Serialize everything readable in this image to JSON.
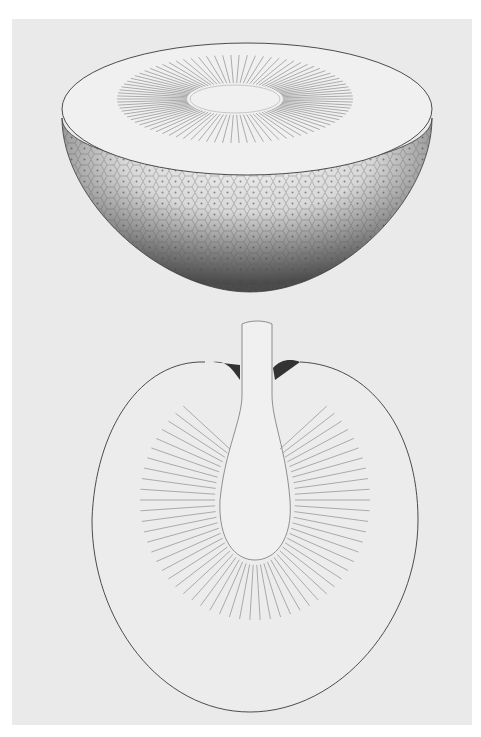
{
  "image": {
    "subject": "Botanical illustration of breadfruit cross-sections",
    "figures": [
      {
        "name": "halved-fruit-top",
        "description": "Hemispherical half of fruit showing cut face with radiating seeds and textured rind"
      },
      {
        "name": "longitudinal-section",
        "description": "Longitudinal section of fruit showing stalk, core and radiating seeds"
      }
    ],
    "colors": {
      "paper": "#eaeaea",
      "margin": "#ffffff",
      "ink": "#3a3a3a",
      "shade": "#5a5a5a"
    }
  }
}
